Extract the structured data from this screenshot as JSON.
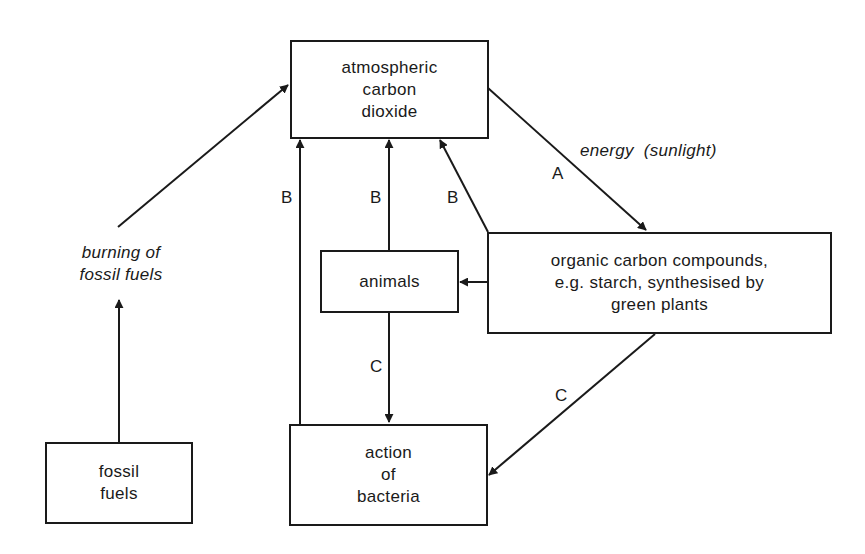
{
  "diagram": {
    "nodes": {
      "atmosphere": {
        "label": "atmospheric\ncarbon\ndioxide"
      },
      "organic": {
        "label": "organic carbon compounds,\ne.g. starch, synthesised by\ngreen plants"
      },
      "animals": {
        "label": "animals"
      },
      "bacteria": {
        "label": "action\nof\nbacteria"
      },
      "fossil": {
        "label": "fossil\nfuels"
      }
    },
    "labels": {
      "energy": "energy  (sunlight)",
      "burning": "burning of\nfossil fuels",
      "A": "A",
      "B1": "B",
      "B2": "B",
      "B3": "B",
      "C1": "C",
      "C2": "C"
    },
    "edges": [
      {
        "from": "atmosphere",
        "to": "organic",
        "label": "A"
      },
      {
        "from": "bacteria",
        "to": "atmosphere",
        "label": "B"
      },
      {
        "from": "animals",
        "to": "atmosphere",
        "label": "B"
      },
      {
        "from": "organic",
        "to": "atmosphere",
        "label": "B"
      },
      {
        "from": "organic",
        "to": "animals",
        "label": ""
      },
      {
        "from": "animals",
        "to": "bacteria",
        "label": "C"
      },
      {
        "from": "organic",
        "to": "bacteria",
        "label": "C"
      },
      {
        "from": "fossil",
        "to": "atmosphere",
        "label": "burning of fossil fuels"
      }
    ]
  }
}
